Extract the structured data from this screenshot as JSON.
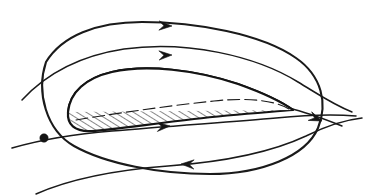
{
  "figure": {
    "title": "Airfoil in a flow field with closed circulation contour",
    "width": 387,
    "height": 195,
    "background_color": "#ffffff",
    "ink_color": "#1a1a1a"
  },
  "airfoil": {
    "name": "airfoil-section",
    "fill_style": "diagonal-hatching",
    "hatch_angle_deg": 55,
    "hatch_spacing_px": 5,
    "hatch_color": "#1a1a1a",
    "outline_color": "#141414",
    "leading_edge": {
      "x": 68,
      "y": 110,
      "shape": "rounded"
    },
    "trailing_edge": {
      "x": 293,
      "y": 110,
      "shape": "sharp-point"
    },
    "chord_length_px": 225,
    "max_thickness_px": 38,
    "camber": "high",
    "upper_surface": "M 68 112 C 70 92 86 78 112 72 C 146 64 196 70 238 84 C 266 94 282 102 293 110",
    "lower_surface": "M 293 110 C 272 112 236 114 194 119 C 150 124 112 130 92 131 C 74 132 67 124 68 112",
    "camber_dash_path": "M 76 120 C 112 114 166 106 214 101 C 250 97 276 101 289 109"
  },
  "contour": {
    "name": "closed-control-contour",
    "stroke_color": "#1a1a1a",
    "stroke_width": 2.1,
    "direction": "clockwise",
    "path": "M 46 62 C 62 36 96 22 142 22 C 196 22 262 34 296 58 C 322 76 328 104 318 128 C 306 156 262 174 210 174 C 160 174 106 164 74 146 C 46 130 36 92 46 62 Z",
    "arrows": [
      {
        "name": "contour-arrow-top",
        "x": 172,
        "y": 26,
        "angle_deg": 2,
        "direction": "right"
      },
      {
        "name": "contour-arrow-bottom",
        "x": 181,
        "y": 164,
        "angle_deg": 182,
        "direction": "left"
      }
    ]
  },
  "streamlines": [
    {
      "name": "streamline-upper",
      "path": "M 22 100 C 46 74 78 56 124 49 C 186 40 256 56 298 82 C 318 94 332 104 352 112",
      "arrows": [
        {
          "name": "streamline-upper-arrow",
          "x": 172,
          "y": 55,
          "angle_deg": -2,
          "direction": "right"
        }
      ]
    },
    {
      "name": "streamline-lower",
      "path": "M 12 148 C 40 140 74 134 112 131 C 168 126 232 122 276 118 C 306 115 332 114 356 116",
      "arrows": [
        {
          "name": "streamline-lower-arrow",
          "x": 170,
          "y": 126,
          "angle_deg": -4,
          "direction": "right"
        }
      ]
    },
    {
      "name": "streamline-bottom",
      "path": "M 36 194 C 72 178 116 170 168 166 C 222 162 272 152 306 136 C 326 126 344 120 362 118",
      "arrows": []
    },
    {
      "name": "streamline-exit-right",
      "path": "M 288 108 C 306 112 322 118 342 126",
      "arrows": [
        {
          "name": "streamline-exit-arrow",
          "x": 322,
          "y": 121,
          "angle_deg": 22,
          "direction": "right-down"
        }
      ]
    }
  ],
  "nodes": [
    {
      "name": "contour-streamline-intersection-left",
      "x": 44,
      "y": 138,
      "radius": 4.2
    }
  ],
  "labels": []
}
